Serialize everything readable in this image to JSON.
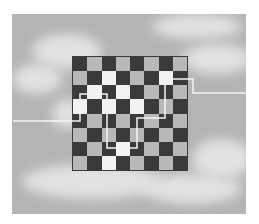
{
  "scene": {
    "description": "Chessboard floating in a cloudy sky with a white line path crossing through it",
    "board": {
      "rows": 8,
      "cols": 8,
      "dark_color": "#3a3a3a",
      "light_color": "#b8b8b8",
      "highlight_color": "#f2f2f2"
    },
    "background": {
      "sky_color": "#b4b4b4",
      "cloud_color": "#e2e2e2"
    },
    "path": {
      "color": "#f5f5f5",
      "points": "13,121 80,121 80,94 107,94 107,148 137,148 137,118 165,118 165,79 193,79 193,93 246,93"
    }
  }
}
